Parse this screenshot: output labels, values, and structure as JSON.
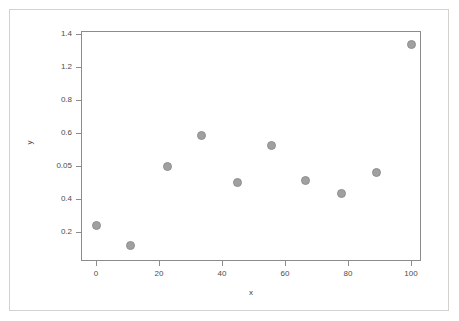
{
  "chart_data": {
    "type": "scatter",
    "title": "",
    "xlabel": "x",
    "ylabel": "y",
    "grid": false,
    "legend": null,
    "marker_color": "#a0a0a0",
    "frame_color": "#8c8c8c",
    "xlim": [
      -4,
      104
    ],
    "xticks": [
      0,
      20,
      40,
      60,
      80,
      100
    ],
    "xticklabels": [
      "0",
      "20",
      "40",
      "60",
      "80",
      "100"
    ],
    "yticklabels": [
      "1.4",
      "1.2",
      "0.8",
      "0.6",
      "0.05",
      "0.4",
      "0.2"
    ],
    "y_axis_kind": "categorical",
    "y_categories_bottom_to_top": [
      "0.2",
      "0.4",
      "0.05",
      "0.6",
      "0.8",
      "1.2",
      "1.4"
    ],
    "x": [
      0,
      11,
      22,
      33,
      44,
      55,
      67,
      78,
      89,
      100
    ],
    "y": [
      "0.2",
      "0.1",
      "0.5",
      "0.58",
      "0.45",
      "0.55",
      "0.46",
      "0.42",
      "0.48",
      "1.35"
    ],
    "points": [
      {
        "x": 0,
        "y": "0.2",
        "px": 96,
        "py": 225
      },
      {
        "x": 11,
        "y": "0.1",
        "px": 130,
        "py": 245
      },
      {
        "x": 22,
        "y": "0.5",
        "px": 167,
        "py": 166
      },
      {
        "x": 33,
        "y": "0.58",
        "px": 201,
        "py": 135
      },
      {
        "x": 44,
        "y": "0.45",
        "px": 237,
        "py": 182
      },
      {
        "x": 55,
        "y": "0.55",
        "px": 271,
        "py": 145
      },
      {
        "x": 67,
        "y": "0.46",
        "px": 305,
        "py": 180
      },
      {
        "x": 78,
        "y": "0.42",
        "px": 341,
        "py": 193
      },
      {
        "x": 89,
        "y": "0.48",
        "px": 376,
        "py": 172
      },
      {
        "x": 100,
        "y": "1.35",
        "px": 411,
        "py": 44
      }
    ],
    "xtick_px": [
      96,
      159,
      222,
      285,
      348,
      411
    ],
    "ytick_px": [
      34,
      67,
      100,
      133,
      166,
      199,
      232
    ]
  }
}
